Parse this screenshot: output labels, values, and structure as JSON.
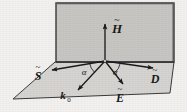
{
  "figure": {
    "background_color": "#f2f1ef",
    "plane_fill": "#c8c6c2",
    "ground_fill": "#d6d4d0",
    "line_color": "#1a1a1a",
    "vertical_plane": {
      "name": "plane-of-incidence",
      "fill": "#c8c6c2",
      "stroke": "#3a3a3a"
    },
    "horizontal_plane": {
      "name": "interface-surface",
      "fill": "#d6d4d0",
      "stroke": "#3a3a3a"
    },
    "origin": {
      "x": 105,
      "y": 61
    },
    "vectors": [
      {
        "id": "H",
        "label": "H",
        "accent": "~",
        "subscript": "",
        "label_x": 117,
        "label_y": 30,
        "accent_x": 117,
        "accent_y": 22,
        "tip_x": 105,
        "tip_y": 21,
        "direction": "up"
      },
      {
        "id": "S",
        "label": "S",
        "accent": "~",
        "subscript": "",
        "label_x": 36,
        "label_y": 78,
        "accent_x": 37,
        "accent_y": 70,
        "tip_x": 49,
        "tip_y": 70,
        "direction": "left"
      },
      {
        "id": "k0",
        "label": "k",
        "accent": "",
        "subscript": "0",
        "label_x": 64,
        "label_y": 98,
        "accent_x": 0,
        "accent_y": 0,
        "tip_x": 76,
        "tip_y": 91,
        "direction": "down-left"
      },
      {
        "id": "E",
        "label": "E",
        "accent": "~",
        "subscript": "",
        "label_x": 119,
        "label_y": 100,
        "accent_x": 120,
        "accent_y": 92,
        "tip_x": 124,
        "tip_y": 85,
        "direction": "down-right"
      },
      {
        "id": "D",
        "label": "D",
        "accent": "~",
        "subscript": "",
        "label_x": 154,
        "label_y": 81,
        "accent_x": 155,
        "accent_y": 73,
        "tip_x": 155,
        "tip_y": 66,
        "direction": "right-up"
      }
    ],
    "angles": [
      {
        "id": "alpha-left",
        "label": "α",
        "x": 82,
        "y": 74
      },
      {
        "id": "alpha-right",
        "label": "α",
        "x": 113,
        "y": 74
      }
    ]
  }
}
